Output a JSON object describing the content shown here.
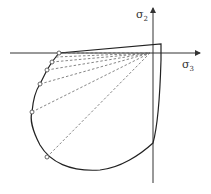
{
  "diagram": {
    "axes": {
      "x_label": "σ",
      "x_label_sub": "3",
      "y_label": "σ",
      "y_label_sub": "2"
    },
    "marked_points_count": 6,
    "colors": {
      "curve": "#222222",
      "axis": "#333333",
      "dashed": "#666666"
    }
  }
}
